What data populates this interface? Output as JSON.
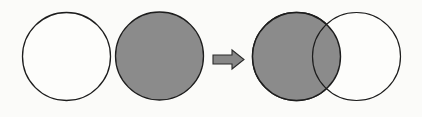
{
  "figure": {
    "name": "set-operation-diagram",
    "background_color": "#fbfbf9",
    "width": 422,
    "height": 117,
    "description": "Two separate circles, one unfilled and one shaded, transform via a right arrow into two overlapping circles with the left circle and the overlapping lens shaded."
  },
  "colors": {
    "fill_shaded": "#8b8b8b",
    "fill_empty": "#fdfdfb",
    "stroke": "#1d1d1d",
    "arrow_fill": "#878787",
    "arrow_stroke": "#2a2a2a"
  },
  "left_group": {
    "name": "input-sets",
    "circles": [
      {
        "name": "circle-a-unfilled",
        "label": "",
        "fill": "none",
        "cx": 66.5,
        "cy": 56.5,
        "r": 44,
        "stroke_width": 1.3
      },
      {
        "name": "circle-b-shaded",
        "label": "",
        "fill": "shaded",
        "cx": 159.5,
        "cy": 56,
        "r": 44,
        "stroke_width": 1.3
      }
    ]
  },
  "arrow": {
    "name": "transform-arrow",
    "direction": "right",
    "x": 213,
    "y": 50,
    "width": 31,
    "height": 19,
    "shaft_height": 9,
    "head_width": 12
  },
  "right_group": {
    "name": "result-sets",
    "circles": [
      {
        "name": "circle-a-result-shaded",
        "label": "",
        "fill": "shaded",
        "cx": 296.5,
        "cy": 56.5,
        "r": 44,
        "stroke_width": 1.4
      },
      {
        "name": "circle-b-result-unfilled",
        "label": "",
        "fill": "none",
        "cx": 356.5,
        "cy": 56.5,
        "r": 44,
        "stroke_width": 1.2
      }
    ],
    "intersection": {
      "name": "intersection-lens",
      "fill": "shaded",
      "shaded": true
    }
  }
}
